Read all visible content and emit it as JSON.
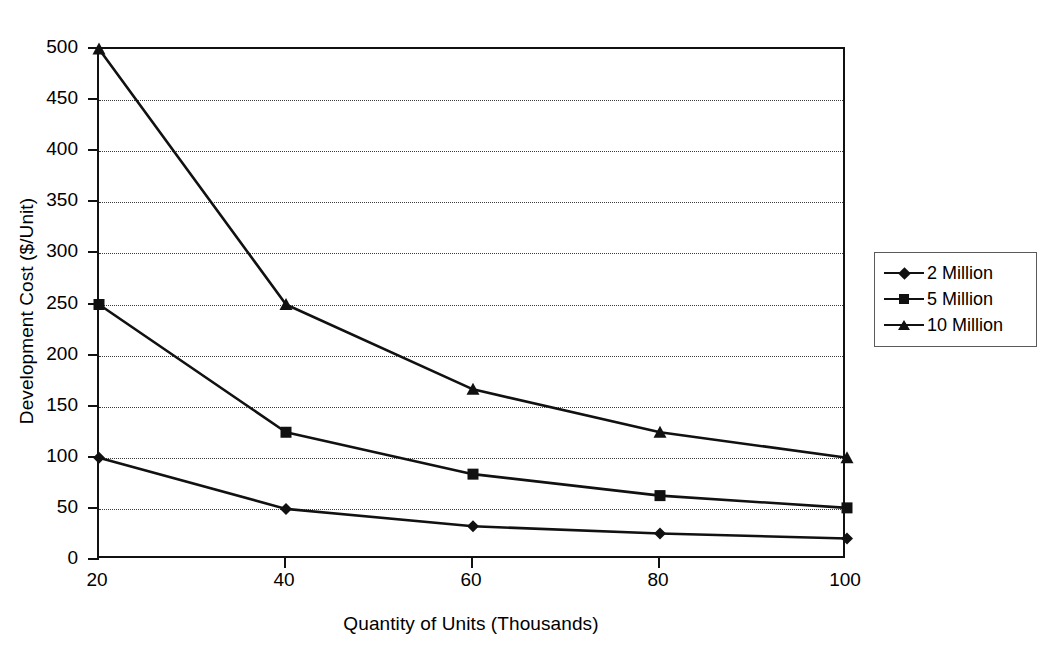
{
  "chart_data": {
    "type": "line",
    "title": "",
    "xlabel": "Quantity of Units (Thousands)",
    "ylabel": "Development Cost ($/Unit)",
    "x": [
      20,
      40,
      60,
      80,
      100
    ],
    "xticks": [
      "20",
      "40",
      "60",
      "80",
      "100"
    ],
    "yticks": [
      "0",
      "50",
      "100",
      "150",
      "200",
      "250",
      "300",
      "350",
      "400",
      "450",
      "500"
    ],
    "xlim": [
      20,
      100
    ],
    "ylim": [
      0,
      500
    ],
    "grid": "horizontal-dotted",
    "legend_position": "right",
    "series": [
      {
        "name": "2 Million",
        "marker": "diamond",
        "values": [
          100,
          50,
          33,
          26,
          21
        ]
      },
      {
        "name": "5 Million",
        "marker": "square",
        "values": [
          250,
          125,
          84,
          63,
          51
        ]
      },
      {
        "name": "10 Million",
        "marker": "triangle",
        "values": [
          500,
          250,
          167,
          125,
          100
        ]
      }
    ]
  },
  "legend": {
    "items": [
      {
        "label": "2 Million"
      },
      {
        "label": "5 Million"
      },
      {
        "label": "10 Million"
      }
    ]
  },
  "colors": {
    "ink": "#111111",
    "grid": "#3a3a3a",
    "background": "#ffffff"
  }
}
